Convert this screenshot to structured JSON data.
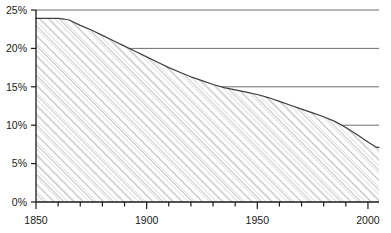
{
  "chart_data": {
    "type": "area",
    "title": "",
    "subtitle": "",
    "xlabel": "",
    "ylabel": "",
    "xlim": [
      1850,
      2005
    ],
    "ylim": [
      0,
      25
    ],
    "grid": true,
    "grid_axis": "y",
    "legend": false,
    "legend_position": "none",
    "y_tick_labels": [
      "0%",
      "5%",
      "10%",
      "15%",
      "20%",
      "25%"
    ],
    "y_tick_values": [
      0,
      5,
      10,
      15,
      20,
      25
    ],
    "x_tick_labels": [
      "1850",
      "1900",
      "1950",
      "2000"
    ],
    "x_tick_values": [
      1850,
      1900,
      1950,
      2000
    ],
    "x_minor_tick_interval": 10,
    "series": [
      {
        "name": "share",
        "x": [
          1850,
          1855,
          1860,
          1863,
          1865,
          1870,
          1875,
          1880,
          1885,
          1890,
          1895,
          1900,
          1905,
          1910,
          1915,
          1920,
          1925,
          1930,
          1935,
          1940,
          1945,
          1950,
          1955,
          1960,
          1965,
          1970,
          1975,
          1980,
          1985,
          1990,
          1995,
          2000,
          2004,
          2005
        ],
        "values": [
          23.9,
          23.9,
          23.9,
          23.8,
          23.7,
          23.0,
          22.4,
          21.7,
          21.0,
          20.3,
          19.6,
          18.9,
          18.2,
          17.5,
          16.9,
          16.3,
          15.8,
          15.3,
          14.9,
          14.6,
          14.3,
          14.0,
          13.6,
          13.1,
          12.6,
          12.1,
          11.6,
          11.1,
          10.5,
          9.7,
          8.8,
          7.8,
          7.1,
          7.1
        ]
      }
    ],
    "colors": {
      "line": "#3f3f3f",
      "fill_hatch": "#9a9a9a",
      "fill_background": "#ffffff",
      "grid": "#6e6e6e",
      "axis": "#1a1a1a",
      "tick_label": "#1a1a1a",
      "page_background": "#ffffff"
    }
  },
  "geometry": {
    "plot_left": 36,
    "plot_right": 379,
    "plot_top": 10,
    "plot_bottom": 202
  }
}
